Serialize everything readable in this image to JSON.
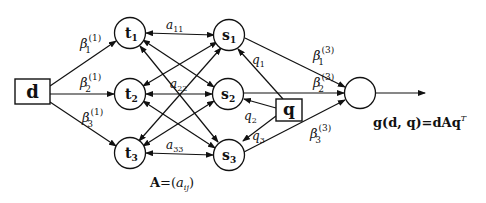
{
  "diagram": {
    "input_node": {
      "label": "d"
    },
    "query_node": {
      "label": "q"
    },
    "t_nodes": [
      {
        "label": "t",
        "sub": "1"
      },
      {
        "label": "t",
        "sub": "2"
      },
      {
        "label": "t",
        "sub": "3"
      }
    ],
    "s_nodes": [
      {
        "label": "s",
        "sub": "1"
      },
      {
        "label": "s",
        "sub": "2"
      },
      {
        "label": "s",
        "sub": "3"
      }
    ],
    "beta1": [
      {
        "sym": "β",
        "sub": "1",
        "sup": "(1)"
      },
      {
        "sym": "β",
        "sub": "2",
        "sup": "(1)"
      },
      {
        "sym": "β",
        "sub": "3",
        "sup": "(1)"
      }
    ],
    "beta3": [
      {
        "sym": "β",
        "sub": "1",
        "sup": "(3)"
      },
      {
        "sym": "β",
        "sub": "2",
        "sup": "(3)"
      },
      {
        "sym": "β",
        "sub": "3",
        "sup": "(3)"
      }
    ],
    "a_labels": [
      {
        "sym": "a",
        "sub": "11"
      },
      {
        "sym": "a",
        "sub": "22"
      },
      {
        "sym": "a",
        "sub": "33"
      }
    ],
    "q_labels": [
      {
        "sym": "q",
        "sub": "1"
      },
      {
        "sym": "q",
        "sub": "2"
      },
      {
        "sym": "q",
        "sub": "3"
      }
    ],
    "matrix_caption": {
      "lhs": "A",
      "eq": "=(",
      "sym": "a",
      "sub": "ij",
      "close": ")"
    },
    "output_formula": {
      "text": "g(d, q)=dAq",
      "sup": "T"
    }
  }
}
